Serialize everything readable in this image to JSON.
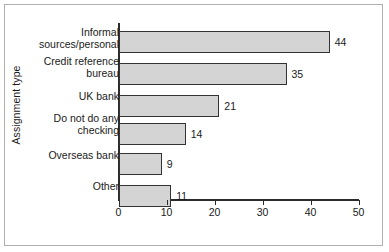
{
  "chart_data": {
    "type": "bar",
    "orientation": "horizontal",
    "title": "",
    "xlabel": "",
    "ylabel": "Assignment type",
    "xlim": [
      0,
      50
    ],
    "xticks": [
      0,
      10,
      20,
      30,
      40,
      50
    ],
    "grid": false,
    "legend": null,
    "categories": [
      "Informal\nsources/personal",
      "Credit reference\nbureau",
      "UK bank",
      "Do not do any\nchecking",
      "Overseas bank",
      "Other"
    ],
    "values": [
      44,
      35,
      21,
      14,
      9,
      11
    ],
    "value_labels": [
      "44",
      "35",
      "21",
      "14",
      "9",
      "11"
    ],
    "bar_fill_color": "#d4d4d4",
    "bar_edge_color": "#333333",
    "axis_color": "#2b2b2b",
    "frame_color": "#b0b0b0",
    "background_color": "#ffffff"
  }
}
